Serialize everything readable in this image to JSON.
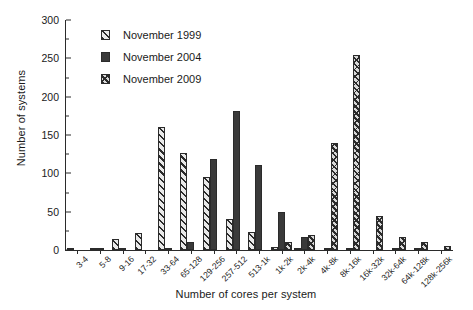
{
  "chart_data": {
    "type": "bar",
    "title": "",
    "xlabel": "Number of cores per system",
    "ylabel": "Number of systems",
    "ylim": [
      0,
      300
    ],
    "yticks": [
      0,
      50,
      100,
      150,
      200,
      250,
      300
    ],
    "grid": false,
    "legend_position": "top-left",
    "categories": [
      "3-4",
      "5-8",
      "9-16",
      "17-32",
      "33-64",
      "65-128",
      "129-256",
      "257-512",
      "513-1k",
      "1k-2k",
      "2k-4k",
      "4k-8k",
      "8k-16k",
      "16k-32k",
      "32k-64k",
      "64k-128k",
      "128k-256k"
    ],
    "series": [
      {
        "name": "November 1999",
        "values": [
          1,
          2,
          14,
          22,
          160,
          127,
          95,
          40,
          24,
          4,
          1,
          0,
          0,
          0,
          0,
          0,
          0
        ]
      },
      {
        "name": "November 2004",
        "values": [
          0,
          3,
          1,
          0,
          2,
          10,
          119,
          181,
          111,
          49,
          17,
          3,
          2,
          0,
          1,
          1,
          0
        ]
      },
      {
        "name": "November 2009",
        "values": [
          0,
          0,
          0,
          0,
          0,
          0,
          0,
          0,
          0,
          10,
          19,
          140,
          255,
          45,
          17,
          10,
          5
        ]
      }
    ]
  },
  "legend": {
    "items": [
      {
        "label": "November 1999",
        "pattern": "diagonal-hatch"
      },
      {
        "label": "November 2004",
        "pattern": "solid-dark"
      },
      {
        "label": "November 2009",
        "pattern": "cross-hatch"
      }
    ]
  },
  "colors": {
    "axis": "#2b2b2b",
    "series_1999": "#e9e9e9",
    "series_2004": "#3a3a3a",
    "series_2009": "#d8d8d8",
    "background": "#ffffff"
  }
}
